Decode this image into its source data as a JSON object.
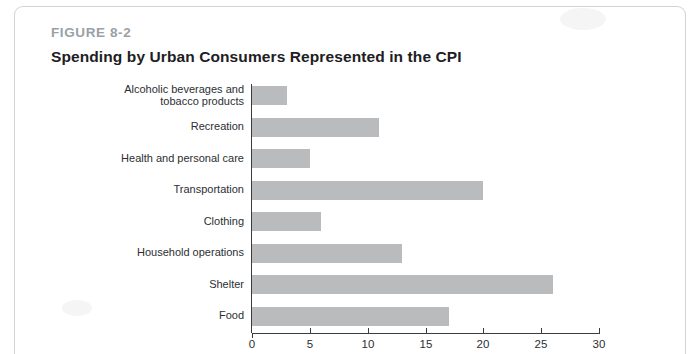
{
  "figure": {
    "label": "FIGURE 8-2",
    "title": "Spending by Urban Consumers Represented in the CPI"
  },
  "chart_data": {
    "type": "bar",
    "orientation": "horizontal",
    "title": "Spending by Urban Consumers Represented in the CPI",
    "xlabel": "",
    "ylabel": "",
    "xlim": [
      0,
      30
    ],
    "xticks": [
      0,
      5,
      10,
      15,
      20,
      25,
      30
    ],
    "grid": false,
    "legend": null,
    "bar_color": "#b9bbbd",
    "categories": [
      "Alcoholic beverages and tobacco products",
      "Recreation",
      "Health and personal care",
      "Transportation",
      "Clothing",
      "Household operations",
      "Shelter",
      "Food"
    ],
    "category_lines": [
      [
        "Alcoholic beverages and",
        "tobacco products"
      ],
      [
        "Recreation"
      ],
      [
        "Health and personal care"
      ],
      [
        "Transportation"
      ],
      [
        "Clothing"
      ],
      [
        "Household operations"
      ],
      [
        "Shelter"
      ],
      [
        "Food"
      ]
    ],
    "values": [
      3,
      11,
      5,
      20,
      6,
      13,
      26,
      17
    ]
  }
}
